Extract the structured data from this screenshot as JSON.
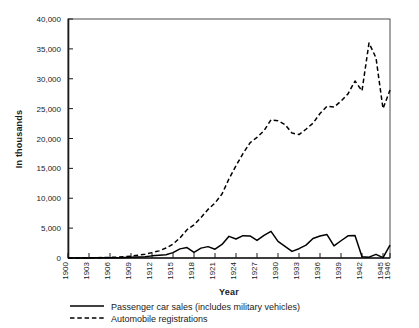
{
  "chart_data": {
    "type": "line",
    "title": "",
    "xlabel": "Year",
    "ylabel": "In thousands",
    "xlim": [
      1900,
      1946
    ],
    "ylim": [
      0,
      40000
    ],
    "ytick_labels": [
      "0",
      "5,000",
      "10,000",
      "15,000",
      "20,000",
      "25,000",
      "30,000",
      "35,000",
      "40,000"
    ],
    "ytick_values": [
      0,
      5000,
      10000,
      15000,
      20000,
      25000,
      30000,
      35000,
      40000
    ],
    "xtick_labels": [
      "1900",
      "1903",
      "1906",
      "1909",
      "1912",
      "1915",
      "1918",
      "1921",
      "1924",
      "1927",
      "1930",
      "1933",
      "1936",
      "1939",
      "1942",
      "1945",
      "1946"
    ],
    "xtick_values": [
      1900,
      1903,
      1906,
      1909,
      1912,
      1915,
      1918,
      1921,
      1924,
      1927,
      1930,
      1933,
      1936,
      1939,
      1942,
      1945,
      1946
    ],
    "grid": false,
    "legend_position": "below-axes",
    "x": [
      1900,
      1901,
      1902,
      1903,
      1904,
      1905,
      1906,
      1907,
      1908,
      1909,
      1910,
      1911,
      1912,
      1913,
      1914,
      1915,
      1916,
      1917,
      1918,
      1919,
      1920,
      1921,
      1922,
      1923,
      1924,
      1925,
      1926,
      1927,
      1928,
      1929,
      1930,
      1931,
      1932,
      1933,
      1934,
      1935,
      1936,
      1937,
      1938,
      1939,
      1940,
      1941,
      1942,
      1943,
      1944,
      1945,
      1946
    ],
    "series": [
      {
        "name": "Passenger car sales (includes military vehicles)",
        "style": "solid",
        "color": "#000000",
        "values": [
          4,
          7,
          9,
          11,
          22,
          24,
          33,
          43,
          64,
          124,
          181,
          199,
          356,
          462,
          548,
          896,
          1526,
          1746,
          944,
          1652,
          1906,
          1468,
          2274,
          3625,
          3186,
          3735,
          3692,
          2937,
          3775,
          4455,
          2787,
          1948,
          1104,
          1560,
          2160,
          3274,
          3679,
          3929,
          2020,
          2889,
          3717,
          3780,
          223,
          139,
          610,
          70,
          2149
        ]
      },
      {
        "name": "Automobile registrations",
        "style": "dashed",
        "color": "#000000",
        "values": [
          8,
          15,
          23,
          33,
          55,
          78,
          106,
          140,
          194,
          306,
          458,
          619,
          902,
          1190,
          1664,
          2332,
          3368,
          4727,
          5554,
          6771,
          8132,
          9212,
          10704,
          13253,
          15436,
          17481,
          19268,
          20193,
          21308,
          23121,
          22973,
          22331,
          20902,
          20664,
          21545,
          22568,
          24183,
          25391,
          25261,
          26240,
          27466,
          29624,
          27973,
          35990,
          33500,
          25000,
          28100
        ]
      }
    ]
  },
  "legend": {
    "entries": [
      {
        "label": "Passenger car sales (includes military vehicles)",
        "style": "solid"
      },
      {
        "label": "Automobile registrations",
        "style": "dashed"
      }
    ]
  }
}
